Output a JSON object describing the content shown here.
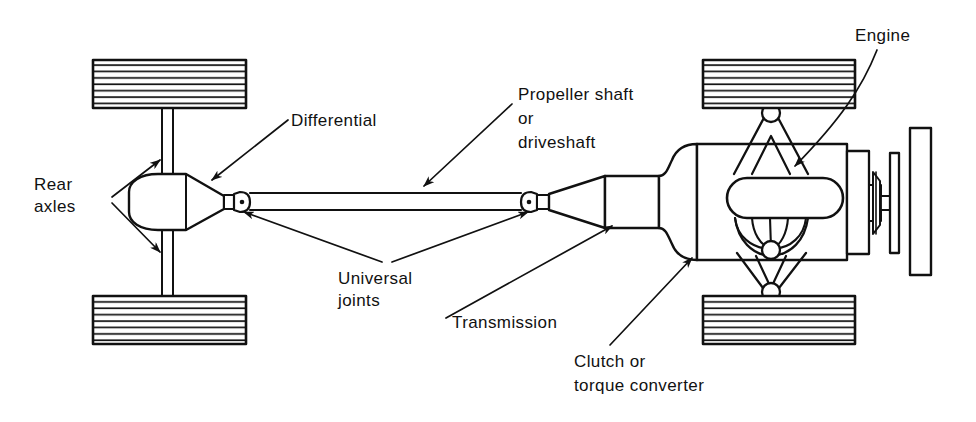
{
  "diagram": {
    "style": {
      "line_color": "#111111",
      "fill_color": "#ffffff",
      "hatch_color": "#111111",
      "background": "#ffffff",
      "stroke_width": 2
    },
    "labels": [
      {
        "id": "rear-axles",
        "lines": [
          "Rear",
          "axles"
        ],
        "text_x": 34,
        "text_y": 190,
        "line_height": 22,
        "anchor": "start"
      },
      {
        "id": "differential",
        "lines": [
          "Differential"
        ],
        "text_x": 291,
        "text_y": 126,
        "line_height": 22,
        "anchor": "start"
      },
      {
        "id": "propeller-shaft",
        "lines": [
          "Propeller shaft",
          "or",
          "driveshaft"
        ],
        "text_x": 518,
        "text_y": 100,
        "line_height": 24,
        "anchor": "start"
      },
      {
        "id": "engine",
        "lines": [
          "Engine"
        ],
        "text_x": 855,
        "text_y": 41,
        "line_height": 22,
        "anchor": "start"
      },
      {
        "id": "universal-joints",
        "lines": [
          "Universal",
          "joints"
        ],
        "text_x": 338,
        "text_y": 284,
        "line_height": 22,
        "anchor": "start"
      },
      {
        "id": "transmission",
        "lines": [
          "Transmission"
        ],
        "text_x": 452,
        "text_y": 328,
        "line_height": 22,
        "anchor": "start"
      },
      {
        "id": "clutch-torque-converter",
        "lines": [
          "Clutch or",
          "torque converter"
        ],
        "text_x": 574,
        "text_y": 367,
        "line_height": 24,
        "anchor": "start"
      }
    ],
    "components": [
      {
        "id": "rear-left-tire",
        "name": "rear-left-tire"
      },
      {
        "id": "rear-right-tire",
        "name": "rear-right-tire"
      },
      {
        "id": "front-left-tire",
        "name": "front-left-tire"
      },
      {
        "id": "front-right-tire",
        "name": "front-right-tire"
      },
      {
        "id": "differential-housing",
        "name": "differential-housing"
      },
      {
        "id": "rear-axle-shafts",
        "name": "rear-axle-shafts"
      },
      {
        "id": "propeller-shaft",
        "name": "propeller-shaft"
      },
      {
        "id": "universal-joint-rear",
        "name": "universal-joint-rear"
      },
      {
        "id": "universal-joint-front",
        "name": "universal-joint-front"
      },
      {
        "id": "transmission-housing",
        "name": "transmission-housing"
      },
      {
        "id": "clutch-bell-housing",
        "name": "clutch-bell-housing"
      },
      {
        "id": "engine-block",
        "name": "engine-block"
      },
      {
        "id": "exhaust-manifold",
        "name": "exhaust-manifold"
      },
      {
        "id": "suspension-upper-a-arm",
        "name": "suspension-upper-a-arm"
      },
      {
        "id": "suspension-lower-a-arm",
        "name": "suspension-lower-a-arm"
      },
      {
        "id": "crank-pulley",
        "name": "crank-pulley"
      },
      {
        "id": "cooling-fan",
        "name": "cooling-fan"
      },
      {
        "id": "radiator",
        "name": "radiator"
      }
    ]
  }
}
